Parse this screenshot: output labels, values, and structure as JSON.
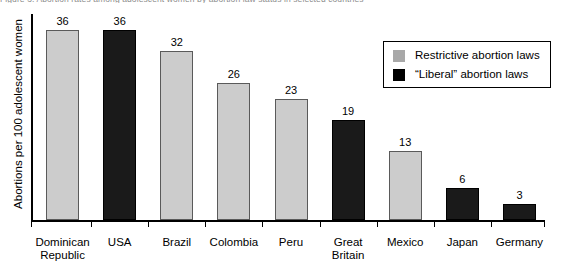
{
  "title_cut_off": "Figure 3: Abortion rates among adolescent women by abortion law status in selected countries",
  "chart_data": {
    "type": "bar",
    "title": "",
    "xlabel": "",
    "ylabel": "Abortions per 100 adolescent women",
    "ylim": [
      0,
      39
    ],
    "grid": false,
    "legend_position": "upper-right",
    "categories": [
      "Dominican\nRepublic",
      "USA",
      "Brazil",
      "Colombia",
      "Peru",
      "Great\nBritain",
      "Mexico",
      "Japan",
      "Germany"
    ],
    "values": [
      36,
      36,
      32,
      26,
      23,
      19,
      13,
      6,
      3
    ],
    "groups": [
      "restrictive",
      "liberal",
      "restrictive",
      "restrictive",
      "restrictive",
      "liberal",
      "restrictive",
      "liberal",
      "liberal"
    ],
    "value_labels": [
      "36",
      "36",
      "32",
      "26",
      "23",
      "19",
      "13",
      "6",
      "3"
    ],
    "legend": [
      {
        "key": "restrictive",
        "label": "Restrictive abortion laws",
        "color": "#a8a8a8"
      },
      {
        "key": "liberal",
        "label": "“Liberal” abortion laws",
        "color": "#000000"
      }
    ],
    "colors": {
      "restrictive_fill": "#cccccc",
      "liberal_fill": "#1a1a1a",
      "axis": "#000000",
      "text": "#000000"
    }
  }
}
